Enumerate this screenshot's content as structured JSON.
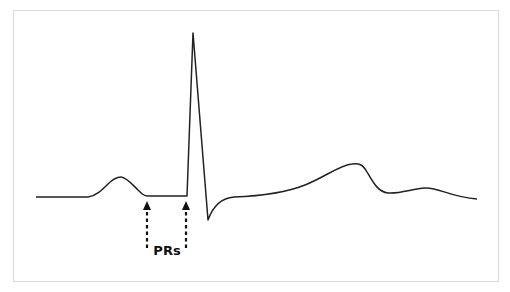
{
  "diagram": {
    "annotation_label": "PRs",
    "colors": {
      "trace": "#222222",
      "frame": "#dcdcdc",
      "background": "#ffffff"
    },
    "waves": [
      "P wave",
      "QRS complex",
      "T wave",
      "U wave"
    ],
    "arrows": [
      {
        "name": "PR segment start",
        "x": 147
      },
      {
        "name": "PR segment end",
        "x": 186
      }
    ]
  }
}
